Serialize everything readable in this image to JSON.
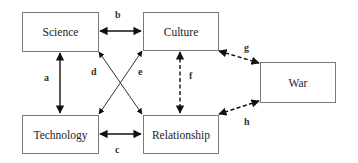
{
  "nodes": {
    "science": "Science",
    "culture": "Culture",
    "technology": "Technology",
    "relationship": "Relationship",
    "war": "War"
  },
  "edges": {
    "a": "a",
    "b": "b",
    "c": "c",
    "d": "d",
    "e": "e",
    "f": "f",
    "g": "g",
    "h": "h"
  },
  "edge_styles": {
    "a": "solid",
    "b": "solid",
    "c": "solid",
    "d": "solid",
    "e": "solid",
    "f": "dashed",
    "g": "dashed",
    "h": "dashed"
  }
}
